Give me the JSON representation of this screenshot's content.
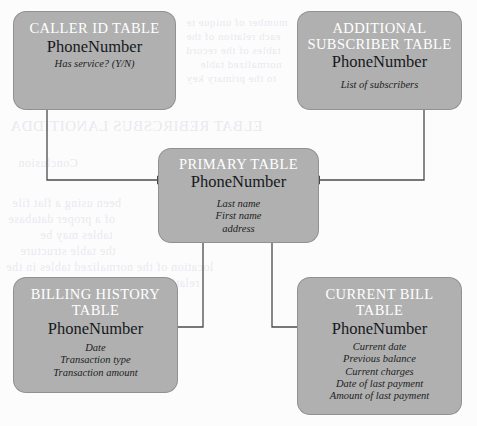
{
  "diagram": {
    "fill_color": "#b0b0b0",
    "title_color": "#ffffff",
    "key_color": "#16181c",
    "line_color": "#4b4b4b",
    "background_color": "#fcfcfd",
    "nodes": [
      {
        "id": "caller-id",
        "title": "CALLER ID TABLE",
        "title_lines": [
          "CALLER ID TABLE"
        ],
        "key": "PhoneNumber",
        "fields": [
          "Has service? (Y/N)"
        ]
      },
      {
        "id": "additional-subscriber",
        "title": "ADDITIONAL SUBSCRIBER TABLE",
        "title_lines": [
          "ADDITIONAL",
          "SUBSCRIBER TABLE"
        ],
        "key": "PhoneNumber",
        "fields": [
          "List of subscribers"
        ]
      },
      {
        "id": "primary",
        "title": "PRIMARY TABLE",
        "title_lines": [
          "PRIMARY TABLE"
        ],
        "key": "PhoneNumber",
        "fields": [
          "Last name",
          "First name",
          "address"
        ]
      },
      {
        "id": "billing-history",
        "title": "BILLING HISTORY TABLE",
        "title_lines": [
          "BILLING HISTORY",
          "TABLE"
        ],
        "key": "PhoneNumber",
        "fields": [
          "Date",
          "Transaction type",
          "Transaction amount"
        ]
      },
      {
        "id": "current-bill",
        "title": "CURRENT BILL TABLE",
        "title_lines": [
          "CURRENT BILL",
          "TABLE"
        ],
        "key": "PhoneNumber",
        "fields": [
          "Current date",
          "Previous balance",
          "Current charges",
          "Date of last payment",
          "Amount of last payment"
        ]
      }
    ],
    "connectors": [
      {
        "id": "caller-id-to-primary",
        "from": "caller-id",
        "to": "primary",
        "arrows": "both"
      },
      {
        "id": "additional-sub-to-primary",
        "from": "additional-subscriber",
        "to": "primary",
        "arrows": "both"
      },
      {
        "id": "primary-to-billing-history",
        "from": "primary",
        "to": "billing-history",
        "arrows": "both"
      },
      {
        "id": "primary-to-current-bill",
        "from": "primary",
        "to": "current-bill",
        "arrows": "both"
      }
    ]
  }
}
